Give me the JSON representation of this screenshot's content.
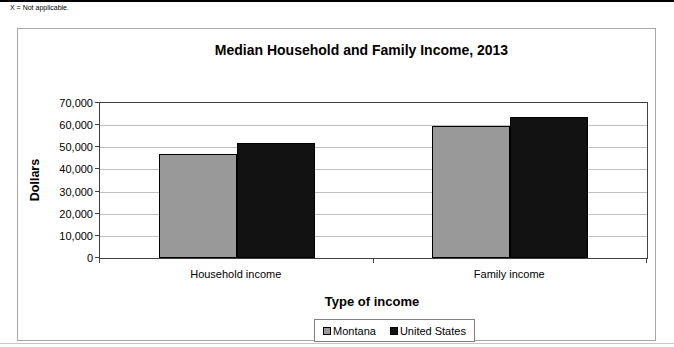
{
  "note": "X = Not applicable.",
  "chart_data": {
    "type": "bar",
    "title": "Median Household and Family Income, 2013",
    "xlabel": "Type of income",
    "ylabel": "Dollars",
    "categories": [
      "Household income",
      "Family income"
    ],
    "series": [
      {
        "name": "Montana",
        "color": "#999999",
        "values": [
          47000,
          59500
        ]
      },
      {
        "name": "United States",
        "color": "#121212",
        "values": [
          52000,
          63500
        ]
      }
    ],
    "ylim": [
      0,
      70000
    ],
    "ytick_interval": 10000,
    "ytick_labels": [
      "0",
      "10,000",
      "20,000",
      "30,000",
      "40,000",
      "50,000",
      "60,000",
      "70,000"
    ],
    "grid": true,
    "legend_position": "bottom"
  },
  "colors": {
    "gridline": "#c0c0c0",
    "plot_border": "#404040",
    "frame_border": "#a6a6a6",
    "top_rule": "#000000",
    "bar_montana": "#999999",
    "bar_united_states": "#121212"
  }
}
